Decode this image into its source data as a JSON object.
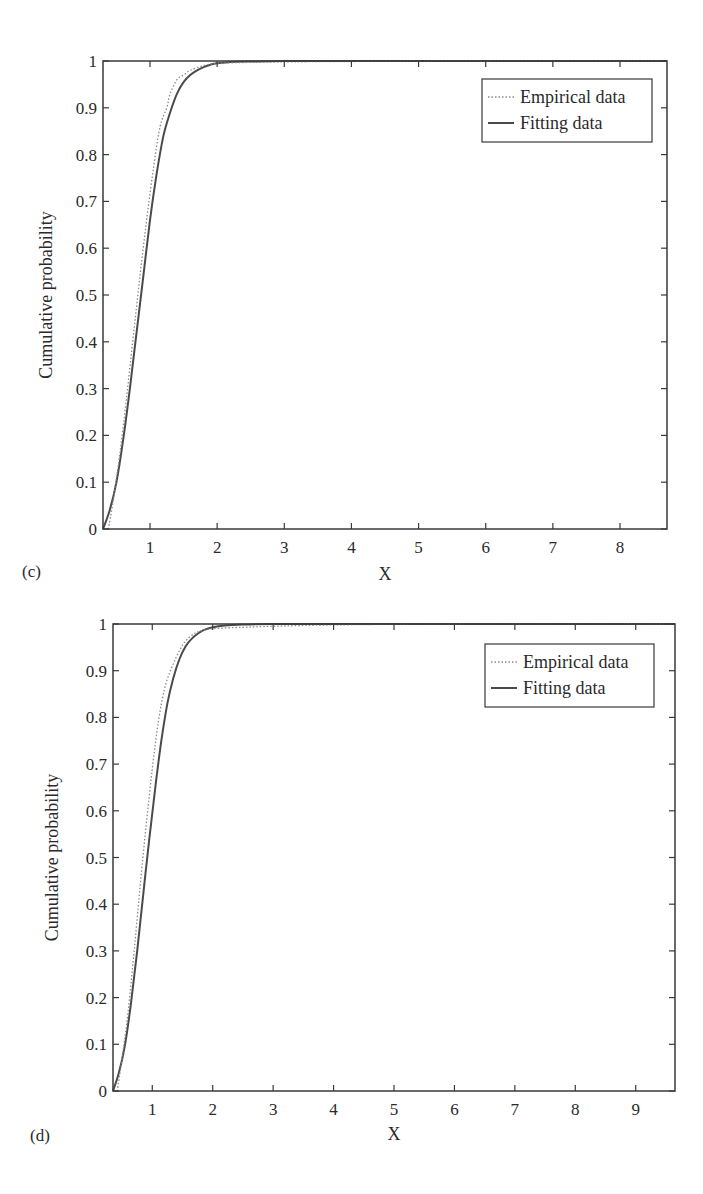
{
  "chart_data": [
    {
      "type": "line",
      "panel": "(c)",
      "xlabel": "X",
      "ylabel": "Cumulative probability",
      "xlim": [
        0.3,
        8.7
      ],
      "ylim": [
        0,
        1
      ],
      "xticks": [
        "1",
        "2",
        "3",
        "4",
        "5",
        "6",
        "7",
        "8"
      ],
      "yticks": [
        "0",
        "0.1",
        "0.2",
        "0.3",
        "0.4",
        "0.5",
        "0.6",
        "0.7",
        "0.8",
        "0.9",
        "1"
      ],
      "grid": false,
      "legend_position": "upper right",
      "legend": [
        "Empirical data",
        "Fitting data"
      ],
      "series": [
        {
          "name": "Empirical data",
          "style": "dotted",
          "x": [
            0.38,
            0.45,
            0.55,
            0.65,
            0.75,
            0.85,
            0.95,
            1.05,
            1.15,
            1.25,
            1.3,
            1.4,
            1.5,
            1.6,
            1.8,
            2.0,
            2.5,
            3.0,
            4.0,
            6.0,
            8.7
          ],
          "y": [
            0.0,
            0.06,
            0.16,
            0.28,
            0.41,
            0.54,
            0.66,
            0.77,
            0.86,
            0.9,
            0.93,
            0.96,
            0.97,
            0.98,
            0.99,
            0.995,
            0.997,
            0.998,
            0.999,
            1.0,
            1.0
          ]
        },
        {
          "name": "Fitting data",
          "style": "solid",
          "x": [
            0.3,
            0.4,
            0.5,
            0.6,
            0.7,
            0.8,
            0.9,
            1.0,
            1.1,
            1.2,
            1.3,
            1.4,
            1.5,
            1.6,
            1.7,
            1.8,
            1.9,
            2.0,
            2.2,
            2.5,
            3.0,
            4.0,
            6.0,
            8.7
          ],
          "y": [
            0.0,
            0.04,
            0.1,
            0.19,
            0.3,
            0.42,
            0.54,
            0.66,
            0.76,
            0.84,
            0.89,
            0.93,
            0.955,
            0.97,
            0.98,
            0.987,
            0.992,
            0.995,
            0.998,
            0.999,
            1.0,
            1.0,
            1.0,
            1.0
          ]
        }
      ]
    },
    {
      "type": "line",
      "panel": "(d)",
      "xlabel": "X",
      "ylabel": "Cumulative probability",
      "xlim": [
        0.35,
        9.65
      ],
      "ylim": [
        0,
        1
      ],
      "xticks": [
        "1",
        "2",
        "3",
        "4",
        "5",
        "6",
        "7",
        "8",
        "9"
      ],
      "yticks": [
        "0",
        "0.1",
        "0.2",
        "0.3",
        "0.4",
        "0.5",
        "0.6",
        "0.7",
        "0.8",
        "0.9",
        "1"
      ],
      "grid": false,
      "legend_position": "upper right",
      "legend": [
        "Empirical data",
        "Fitting data"
      ],
      "series": [
        {
          "name": "Empirical data",
          "style": "dotted",
          "x": [
            0.42,
            0.5,
            0.6,
            0.7,
            0.8,
            0.9,
            1.0,
            1.1,
            1.2,
            1.3,
            1.4,
            1.5,
            1.6,
            1.7,
            1.8,
            2.0,
            2.5,
            3.0,
            4.0,
            6.0,
            9.65
          ],
          "y": [
            0.0,
            0.07,
            0.17,
            0.3,
            0.44,
            0.57,
            0.69,
            0.79,
            0.86,
            0.9,
            0.93,
            0.955,
            0.97,
            0.98,
            0.985,
            0.99,
            0.993,
            0.995,
            0.998,
            1.0,
            1.0
          ]
        },
        {
          "name": "Fitting data",
          "style": "solid",
          "x": [
            0.35,
            0.45,
            0.55,
            0.65,
            0.75,
            0.85,
            0.95,
            1.05,
            1.15,
            1.25,
            1.35,
            1.45,
            1.55,
            1.65,
            1.75,
            1.85,
            2.0,
            2.2,
            2.5,
            3.0,
            4.0,
            6.0,
            9.65
          ],
          "y": [
            0.0,
            0.04,
            0.1,
            0.19,
            0.3,
            0.42,
            0.54,
            0.65,
            0.75,
            0.83,
            0.885,
            0.925,
            0.952,
            0.968,
            0.979,
            0.987,
            0.993,
            0.997,
            0.999,
            1.0,
            1.0,
            1.0,
            1.0
          ]
        }
      ]
    }
  ],
  "panels": [
    {
      "label": "(c)",
      "xlabel": "X",
      "ylabel": "Cumulative probability",
      "legend_empirical": "Empirical data",
      "legend_fitting": "Fitting data"
    },
    {
      "label": "(d)",
      "xlabel": "X",
      "ylabel": "Cumulative probability",
      "legend_empirical": "Empirical data",
      "legend_fitting": "Fitting data"
    }
  ],
  "colors": {
    "axis": "#3a3a3a",
    "fitting_line": "#4a4a4a",
    "empirical_line": "#8a8a8a"
  }
}
